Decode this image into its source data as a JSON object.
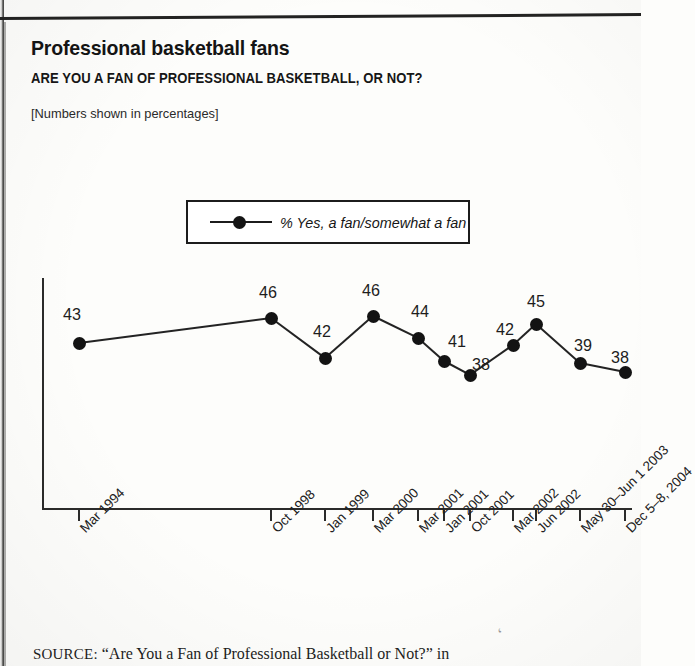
{
  "page": {
    "title": "Professional basketball fans",
    "subtitle": "ARE YOU A FAN OF PROFESSIONAL BASKETBALL, OR NOT?",
    "note": "[Numbers shown in percentages]",
    "source_prefix": "SOURCE:",
    "source_text": "“Are You a Fan of Professional Basketball or Not?” in",
    "stray_mark": "‘"
  },
  "legend": {
    "position": "top-center",
    "entries": [
      {
        "label": "% Yes, a fan/somewhat a fan",
        "color": "#131313",
        "marker": "filled-circle"
      }
    ]
  },
  "chart_data": {
    "type": "line",
    "title": "Professional basketball fans",
    "subtitle": "ARE YOU A FAN OF PROFESSIONAL BASKETBALL, OR NOT?",
    "xlabel": "",
    "ylabel": "",
    "ylim": [
      0,
      50
    ],
    "grid": false,
    "legend_position": "top-center",
    "annotation": "[Numbers shown in percentages]",
    "categories": [
      "Mar 1994",
      "Oct 1998",
      "Jan 1999",
      "Mar 2000",
      "Mar 2001",
      "Jan 2001",
      "Oct 2001",
      "Mar 2002",
      "Jun 2002",
      "May 30–Jun 1 2003",
      "Dec 5–8, 2004"
    ],
    "series": [
      {
        "name": "% Yes, a fan/somewhat a fan",
        "values": [
          43,
          46,
          42,
          46,
          44,
          41,
          38,
          42,
          45,
          39,
          38
        ],
        "color": "#131313"
      }
    ],
    "point_pixels": [
      {
        "x": 79,
        "y": 343,
        "label": "43",
        "lx": 72,
        "ly": 305
      },
      {
        "x": 271,
        "y": 318,
        "label": "46",
        "lx": 268,
        "ly": 283
      },
      {
        "x": 325,
        "y": 358,
        "label": "42",
        "lx": 322,
        "ly": 322
      },
      {
        "x": 373,
        "y": 316,
        "label": "46",
        "lx": 371,
        "ly": 281
      },
      {
        "x": 418,
        "y": 338,
        "label": "44",
        "lx": 420,
        "ly": 302
      },
      {
        "x": 444,
        "y": 361,
        "label": "41",
        "lx": 457,
        "ly": 332
      },
      {
        "x": 470,
        "y": 375,
        "label": "38",
        "lx": 481,
        "ly": 355
      },
      {
        "x": 513,
        "y": 345,
        "label": "42",
        "lx": 505,
        "ly": 320
      },
      {
        "x": 536,
        "y": 324,
        "label": "45",
        "lx": 536,
        "ly": 292
      },
      {
        "x": 580,
        "y": 363,
        "label": "39",
        "lx": 583,
        "ly": 336
      },
      {
        "x": 625,
        "y": 372,
        "label": "38",
        "lx": 620,
        "ly": 348
      }
    ],
    "tick_pixels": [
      79,
      271,
      325,
      373,
      418,
      444,
      470,
      513,
      536,
      580,
      625
    ],
    "axis_pixels": {
      "x0": 42,
      "y0": 278,
      "x1": 632,
      "y1": 508
    }
  }
}
